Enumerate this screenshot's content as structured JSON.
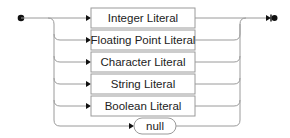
{
  "diagram": {
    "type": "railroad-syntax-diagram",
    "start_marker": "filled-circle",
    "end_marker": "bar-filled-circle",
    "alternatives": [
      {
        "label": "Integer Literal",
        "kind": "nonterminal"
      },
      {
        "label": "Floating Point Literal",
        "kind": "nonterminal"
      },
      {
        "label": "Character Literal",
        "kind": "nonterminal"
      },
      {
        "label": "String Literal",
        "kind": "nonterminal"
      },
      {
        "label": "Boolean Literal",
        "kind": "nonterminal"
      },
      {
        "label": "null",
        "kind": "terminal"
      }
    ]
  },
  "colors": {
    "line": "#9a9a9a",
    "marker": "#111111",
    "text": "#222222"
  }
}
